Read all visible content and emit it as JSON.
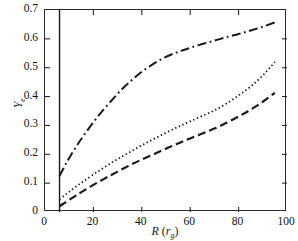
{
  "chart_data": {
    "type": "line",
    "title": "",
    "xlabel": "R (r_g)",
    "xlabel_main": "R",
    "xlabel_unit_open": "(",
    "xlabel_unit_base": "r",
    "xlabel_unit_sub": "g",
    "xlabel_unit_close": ")",
    "ylabel": "Y_e",
    "ylabel_base": "Y",
    "ylabel_sub": "e",
    "xlim": [
      0,
      100
    ],
    "ylim": [
      0,
      0.7
    ],
    "xticks": [
      0,
      20,
      40,
      60,
      80,
      100
    ],
    "xtick_labels": [
      "0",
      "20",
      "40",
      "60",
      "80",
      "100"
    ],
    "yticks": [
      0,
      0.1,
      0.2,
      0.3,
      0.4,
      0.5,
      0.6,
      0.7
    ],
    "ytick_labels": [
      "0",
      "0.1",
      "0.2",
      "0.3",
      "0.4",
      "0.5",
      "0.6",
      "0.7"
    ],
    "grid": false,
    "legend": "none",
    "line_color": "#1a1a1a",
    "frame_color": "#2a2a2a",
    "annotations": [
      {
        "name": "inner-boundary-line",
        "type": "vline",
        "x": 6,
        "style": "solid",
        "label": ""
      }
    ],
    "series": [
      {
        "name": "curve-upper",
        "style": "dashdot",
        "dasharray": "9,3.5,1.8,3.5",
        "width": 2.0,
        "x": [
          6,
          8,
          10,
          13,
          16,
          20,
          24,
          28,
          32,
          36,
          40,
          44,
          48,
          52,
          56,
          60,
          65,
          70,
          75,
          80,
          85,
          90,
          95
        ],
        "y": [
          0.125,
          0.157,
          0.187,
          0.228,
          0.265,
          0.311,
          0.353,
          0.391,
          0.427,
          0.458,
          0.486,
          0.509,
          0.529,
          0.545,
          0.558,
          0.569,
          0.582,
          0.594,
          0.606,
          0.617,
          0.629,
          0.642,
          0.657
        ]
      },
      {
        "name": "curve-middle",
        "style": "dotted",
        "dasharray": "1.4,2.6",
        "width": 1.8,
        "x": [
          6,
          8,
          10,
          13,
          16,
          20,
          24,
          28,
          32,
          36,
          40,
          44,
          48,
          52,
          56,
          60,
          65,
          70,
          75,
          80,
          85,
          90,
          95
        ],
        "y": [
          0.044,
          0.057,
          0.07,
          0.089,
          0.107,
          0.13,
          0.152,
          0.173,
          0.193,
          0.212,
          0.231,
          0.249,
          0.266,
          0.283,
          0.299,
          0.314,
          0.333,
          0.352,
          0.376,
          0.404,
          0.435,
          0.473,
          0.52
        ]
      },
      {
        "name": "curve-lower",
        "style": "dashed",
        "dasharray": "8,4",
        "width": 2.2,
        "x": [
          6,
          8,
          10,
          13,
          16,
          20,
          24,
          28,
          32,
          36,
          40,
          44,
          48,
          52,
          56,
          60,
          65,
          70,
          75,
          80,
          85,
          90,
          95
        ],
        "y": [
          0.02,
          0.031,
          0.042,
          0.058,
          0.074,
          0.094,
          0.113,
          0.131,
          0.149,
          0.166,
          0.182,
          0.197,
          0.212,
          0.227,
          0.241,
          0.255,
          0.272,
          0.289,
          0.309,
          0.331,
          0.355,
          0.382,
          0.413
        ]
      }
    ]
  }
}
